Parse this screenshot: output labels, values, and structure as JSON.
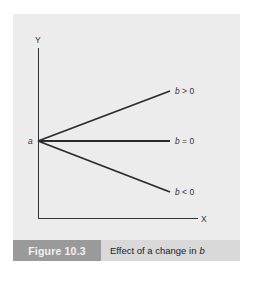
{
  "figure": {
    "number_label": "Figure 10.3",
    "caption_text": "Effect of a change in",
    "caption_var": "b"
  },
  "axes": {
    "y_label": "Y",
    "x_label": "X",
    "intercept_label": "a"
  },
  "lines": [
    {
      "label_var": "b",
      "label_rel": " > 0"
    },
    {
      "label_var": "b",
      "label_rel": " = 0"
    },
    {
      "label_var": "b",
      "label_rel": " < 0"
    }
  ],
  "colors": {
    "panel": "#ececec",
    "caption_label_bg": "#9a9a9a",
    "caption_text_bg": "#d9d9d9",
    "line": "#2a2a2a"
  }
}
